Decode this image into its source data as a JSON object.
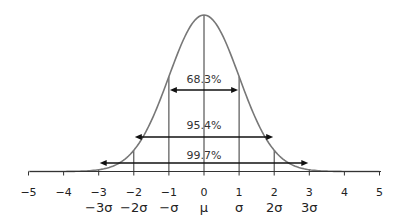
{
  "chart_data": {
    "type": "line",
    "title": "",
    "subtitle": "",
    "xlabel": "",
    "ylabel": "",
    "xlim": [
      -5,
      5
    ],
    "ylim": [
      0,
      0.4
    ],
    "grid": false,
    "legend": null,
    "x_ticks": [
      -5,
      -4,
      -3,
      -2,
      -1,
      0,
      1,
      2,
      3,
      4,
      5
    ],
    "x_tick_labels": [
      "−5",
      "−4",
      "−3",
      "−2",
      "−1",
      "0",
      "1",
      "2",
      "3",
      "4",
      "5"
    ],
    "sigma_labels": [
      {
        "x": -3,
        "label": "−3σ"
      },
      {
        "x": -2,
        "label": "−2σ"
      },
      {
        "x": -1,
        "label": "−σ"
      },
      {
        "x": 0,
        "label": "μ"
      },
      {
        "x": 1,
        "label": "σ"
      },
      {
        "x": 2,
        "label": "2σ"
      },
      {
        "x": 3,
        "label": "3σ"
      }
    ],
    "series": [
      {
        "name": "Normal distribution PDF",
        "mean": 0,
        "sd": 1,
        "curve_color": "#777777"
      }
    ],
    "vertical_lines": [
      -3,
      -2,
      -1,
      0,
      1,
      2,
      3
    ],
    "intervals": [
      {
        "from": -1,
        "to": 1,
        "label": "68.3%",
        "value": 68.3
      },
      {
        "from": -2,
        "to": 2,
        "label": "95.4%",
        "value": 95.4
      },
      {
        "from": -3,
        "to": 3,
        "label": "99.7%",
        "value": 99.7
      }
    ]
  },
  "style": {
    "curve_color": "#777777",
    "line_color": "#333333",
    "arrow_color": "#111111"
  }
}
